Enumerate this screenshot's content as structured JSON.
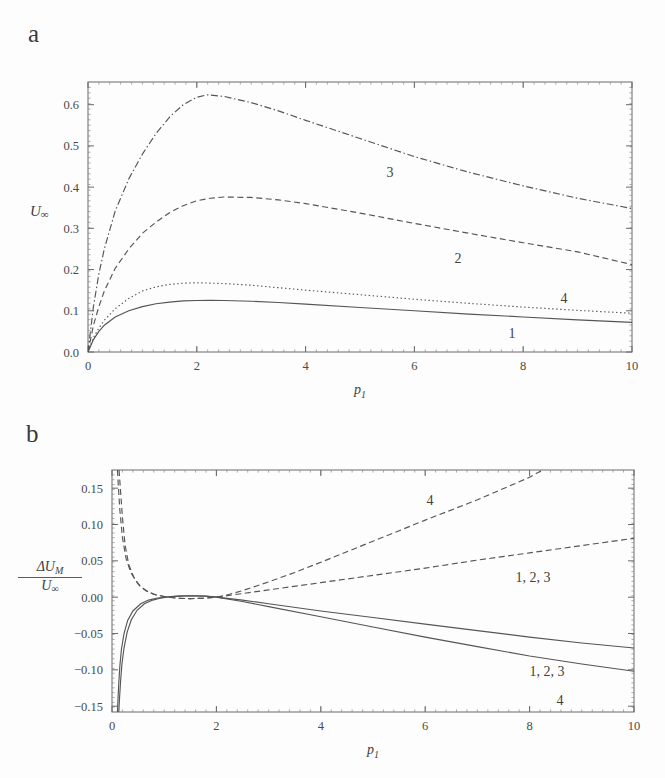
{
  "figure": {
    "background": "#fdfdfd",
    "line_color": "#555555",
    "axis_color": "#6a6a6a",
    "text_color": "#3f3f3f"
  },
  "panels": {
    "a": {
      "letter": "a",
      "ylabel": "U",
      "ylabel_sub": "∞",
      "xlabel": "p",
      "xlabel_sub": "1",
      "xticks": [
        "0",
        "2",
        "4",
        "6",
        "8",
        "10"
      ],
      "yticks": [
        "0.0",
        "0.1",
        "0.2",
        "0.3",
        "0.4",
        "0.5",
        "0.6"
      ],
      "curve_labels": [
        "1",
        "2",
        "3",
        "4"
      ]
    },
    "b": {
      "letter": "b",
      "ylabel_num": "ΔU",
      "ylabel_num_sub": "M",
      "ylabel_den": "U",
      "ylabel_den_sub": "∞",
      "xlabel": "p",
      "xlabel_sub": "1",
      "xticks": [
        "0",
        "2",
        "4",
        "6",
        "8",
        "10"
      ],
      "yticks": [
        "0.15",
        "0.10",
        "0.05",
        "0.00",
        "−0.05",
        "−0.10",
        "−0.15"
      ],
      "curve_labels": [
        "4",
        "1, 2, 3",
        "1, 2, 3",
        "4"
      ]
    }
  },
  "chart_data": [
    {
      "type": "line",
      "panel": "a",
      "title": "",
      "xlabel": "p1",
      "ylabel": "U∞",
      "xlim": [
        0,
        10
      ],
      "ylim": [
        0.0,
        0.655
      ],
      "grid": false,
      "legend": "inline-curve-labels",
      "xticks": [
        0,
        2,
        4,
        6,
        8,
        10
      ],
      "yticks": [
        0.0,
        0.1,
        0.2,
        0.3,
        0.4,
        0.5,
        0.6
      ],
      "series": [
        {
          "name": "1",
          "style": "solid",
          "x": [
            0,
            0.1,
            0.2,
            0.3,
            0.5,
            0.75,
            1.0,
            1.25,
            1.5,
            1.75,
            2.0,
            2.25,
            2.5,
            3.0,
            3.5,
            4.0,
            5.0,
            6.0,
            7.0,
            8.0,
            9.0,
            10.0
          ],
          "y": [
            0.0,
            0.03,
            0.05,
            0.065,
            0.085,
            0.1,
            0.11,
            0.117,
            0.121,
            0.124,
            0.125,
            0.1255,
            0.125,
            0.123,
            0.12,
            0.116,
            0.108,
            0.1,
            0.092,
            0.085,
            0.078,
            0.072
          ]
        },
        {
          "name": "4",
          "style": "dotted",
          "x": [
            0,
            0.1,
            0.2,
            0.3,
            0.5,
            0.75,
            1.0,
            1.25,
            1.5,
            1.75,
            2.0,
            2.5,
            3.0,
            3.5,
            4.0,
            5.0,
            6.0,
            7.0,
            8.0,
            9.0,
            10.0
          ],
          "y": [
            0.0,
            0.035,
            0.058,
            0.077,
            0.105,
            0.13,
            0.148,
            0.158,
            0.164,
            0.167,
            0.168,
            0.166,
            0.162,
            0.156,
            0.15,
            0.139,
            0.128,
            0.118,
            0.109,
            0.101,
            0.094
          ]
        },
        {
          "name": "2",
          "style": "dashed",
          "x": [
            0,
            0.1,
            0.2,
            0.3,
            0.5,
            0.75,
            1.0,
            1.25,
            1.5,
            1.75,
            2.0,
            2.25,
            2.5,
            3.0,
            3.5,
            4.0,
            5.0,
            6.0,
            7.0,
            8.0,
            9.0,
            10.0
          ],
          "y": [
            0.0,
            0.065,
            0.11,
            0.148,
            0.203,
            0.25,
            0.288,
            0.315,
            0.338,
            0.355,
            0.367,
            0.373,
            0.376,
            0.375,
            0.369,
            0.36,
            0.337,
            0.312,
            0.288,
            0.265,
            0.243,
            0.212
          ]
        },
        {
          "name": "3",
          "style": "dashdot",
          "x": [
            0,
            0.1,
            0.2,
            0.3,
            0.5,
            0.75,
            1.0,
            1.25,
            1.5,
            1.75,
            2.0,
            2.2,
            2.5,
            3.0,
            3.5,
            4.0,
            5.0,
            6.0,
            7.0,
            8.0,
            9.0,
            10.0
          ],
          "y": [
            0.0,
            0.11,
            0.19,
            0.25,
            0.342,
            0.42,
            0.48,
            0.53,
            0.57,
            0.6,
            0.618,
            0.624,
            0.62,
            0.605,
            0.585,
            0.562,
            0.518,
            0.474,
            0.436,
            0.403,
            0.373,
            0.348
          ]
        }
      ]
    },
    {
      "type": "line",
      "panel": "b",
      "title": "",
      "xlabel": "p1",
      "ylabel": "ΔU_M / U∞",
      "xlim": [
        0,
        10
      ],
      "ylim": [
        -0.158,
        0.175
      ],
      "grid": false,
      "legend": "inline-curve-labels",
      "xticks": [
        0,
        2,
        4,
        6,
        8,
        10
      ],
      "yticks": [
        0.15,
        0.1,
        0.05,
        0.0,
        -0.05,
        -0.1,
        -0.15
      ],
      "series": [
        {
          "name": "4-upper",
          "label": "4",
          "style": "dashed",
          "x": [
            0.135,
            0.16,
            0.2,
            0.25,
            0.32,
            0.42,
            0.55,
            0.7,
            0.85,
            1.0,
            1.25,
            1.5,
            1.75,
            2.0,
            2.25,
            2.5,
            3.0,
            3.5,
            4.0,
            5.0,
            6.0,
            7.0,
            8.0,
            8.25
          ],
          "y": [
            0.175,
            0.15,
            0.11,
            0.072,
            0.045,
            0.027,
            0.014,
            0.007,
            0.003,
            0.001,
            -0.0015,
            -0.002,
            -0.0015,
            0.0,
            0.004,
            0.009,
            0.021,
            0.034,
            0.048,
            0.077,
            0.106,
            0.134,
            0.165,
            0.175
          ]
        },
        {
          "name": "123-upper",
          "label": "1, 2, 3",
          "style": "dashed",
          "x": [
            0.105,
            0.12,
            0.15,
            0.2,
            0.27,
            0.36,
            0.5,
            0.65,
            0.8,
            1.0,
            1.25,
            1.5,
            1.75,
            2.0,
            2.5,
            3.0,
            4.0,
            5.0,
            6.0,
            7.0,
            8.0,
            9.0,
            10.0
          ],
          "y": [
            0.175,
            0.155,
            0.12,
            0.082,
            0.053,
            0.034,
            0.018,
            0.009,
            0.004,
            0.001,
            -0.0015,
            -0.002,
            -0.0015,
            0.0,
            0.005,
            0.01,
            0.02,
            0.03,
            0.04,
            0.051,
            0.061,
            0.071,
            0.081
          ]
        },
        {
          "name": "123-lower",
          "label": "1, 2, 3",
          "style": "solid",
          "x": [
            0.105,
            0.115,
            0.13,
            0.15,
            0.18,
            0.23,
            0.3,
            0.4,
            0.55,
            0.7,
            0.85,
            1.0,
            1.25,
            1.5,
            1.75,
            2.0,
            2.5,
            3.0,
            4.0,
            5.0,
            6.0,
            7.0,
            8.0,
            9.0,
            10.0
          ],
          "y": [
            -0.158,
            -0.14,
            -0.118,
            -0.095,
            -0.072,
            -0.05,
            -0.032,
            -0.019,
            -0.009,
            -0.004,
            -0.0015,
            0.0,
            0.0015,
            0.002,
            0.0015,
            0.0,
            -0.004,
            -0.009,
            -0.019,
            -0.028,
            -0.037,
            -0.046,
            -0.055,
            -0.063,
            -0.07
          ]
        },
        {
          "name": "4-lower",
          "label": "4",
          "style": "solid",
          "x": [
            0.13,
            0.145,
            0.165,
            0.19,
            0.23,
            0.29,
            0.37,
            0.48,
            0.62,
            0.78,
            0.92,
            1.05,
            1.3,
            1.55,
            1.8,
            2.0,
            2.5,
            3.0,
            4.0,
            5.0,
            6.0,
            7.0,
            8.0,
            9.0,
            10.0
          ],
          "y": [
            -0.158,
            -0.138,
            -0.115,
            -0.092,
            -0.07,
            -0.048,
            -0.031,
            -0.018,
            -0.009,
            -0.004,
            -0.0015,
            0.0,
            0.0015,
            0.002,
            0.0015,
            0.0,
            -0.006,
            -0.013,
            -0.027,
            -0.041,
            -0.055,
            -0.068,
            -0.081,
            -0.092,
            -0.102
          ]
        }
      ]
    }
  ]
}
